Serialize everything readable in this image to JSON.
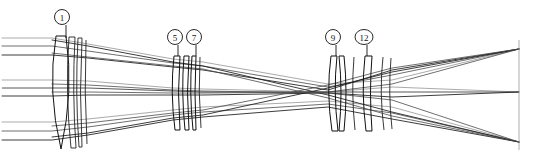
{
  "diagram": {
    "background_color": "#ffffff",
    "line_color": "#1a1a1a",
    "width": 547,
    "height": 166,
    "optical_axis_y": 92
  },
  "callouts": [
    {
      "id": "c1",
      "label": "1",
      "cx": 62,
      "cy": 17,
      "leader_x": 66,
      "leader_y1": 25,
      "leader_y2": 38
    },
    {
      "id": "c5",
      "label": "5",
      "cx": 175,
      "cy": 37,
      "leader_x": 178,
      "leader_y1": 45,
      "leader_y2": 56
    },
    {
      "id": "c7",
      "label": "7",
      "cx": 194,
      "cy": 37,
      "leader_x": 196,
      "leader_y1": 45,
      "leader_y2": 56
    },
    {
      "id": "c9",
      "label": "9",
      "cx": 333,
      "cy": 37,
      "leader_x": 336,
      "leader_y1": 45,
      "leader_y2": 56
    },
    {
      "id": "c12",
      "label": "12",
      "cx": 364,
      "cy": 37,
      "leader_x": 367,
      "leader_y1": 45,
      "leader_y2": 56
    }
  ],
  "groups": [
    {
      "name": "front-group",
      "element_count": 4,
      "x_start": 52,
      "x_end": 88
    },
    {
      "name": "middle-group",
      "element_count": 4,
      "x_start": 173,
      "x_end": 203
    },
    {
      "name": "rear-group",
      "element_count": 5,
      "x_start": 328,
      "x_end": 392
    }
  ],
  "image_plane": {
    "x": 519,
    "y_top": 40,
    "y_bottom": 150
  },
  "focal_points": [
    {
      "name": "upper-field-focus",
      "x": 519,
      "y": 49
    },
    {
      "name": "axial-focus",
      "x": 519,
      "y": 92
    },
    {
      "name": "lower-field-focus",
      "x": 519,
      "y": 142
    }
  ],
  "ray_bundles": [
    {
      "name": "upper-field-bundle",
      "entry_heights": [
        38,
        46,
        55
      ],
      "focus_y": 49
    },
    {
      "name": "axial-bundle",
      "entry_heights": [
        80,
        88,
        96
      ],
      "focus_y": 92
    },
    {
      "name": "lower-field-bundle",
      "entry_heights": [
        122,
        131,
        140
      ],
      "focus_y": 142
    }
  ]
}
